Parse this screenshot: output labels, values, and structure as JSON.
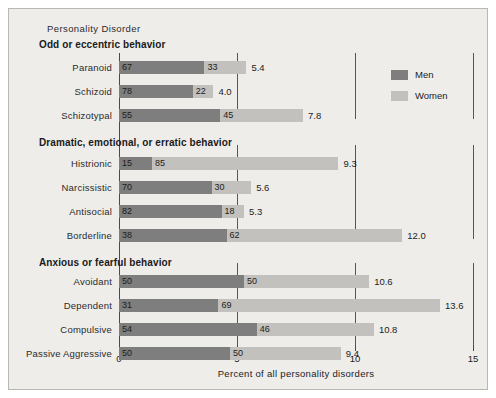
{
  "panel": {
    "background_color": "#eeedea",
    "border_color": "#b9b7b2"
  },
  "header": {
    "supertitle": "Personality Disorder"
  },
  "axis": {
    "title": "Percent of all personality disorders",
    "tick_labels": [
      "0",
      "5",
      "10",
      "15"
    ]
  },
  "legend": {
    "items": [
      {
        "label": "Men",
        "color": "#7e7e7e"
      },
      {
        "label": "Women",
        "color": "#c2c1bd"
      }
    ]
  },
  "chart_data": {
    "type": "bar",
    "orientation": "horizontal",
    "stacked": true,
    "title": "Personality Disorder",
    "xlabel": "Percent of all personality disorders",
    "ylabel": "",
    "xlim": [
      0,
      15
    ],
    "xticks": [
      0,
      5,
      10,
      15
    ],
    "grid": false,
    "legend_position": "upper-right",
    "note": "Each bar's full length is the total percent of all personality disorders; the dark and light segments split that total into the percent of cases that are Men and Women respectively.",
    "series": [
      {
        "name": "Men",
        "color": "#7e7e7e",
        "unit": "percent of cases within disorder"
      },
      {
        "name": "Women",
        "color": "#c2c1bd",
        "unit": "percent of cases within disorder"
      }
    ],
    "sections": [
      {
        "name": "Odd or eccentric behavior",
        "rows": [
          {
            "category": "Paranoid",
            "men": 67,
            "women": 33,
            "total": 5.4,
            "total_label": "5.4"
          },
          {
            "category": "Schizoid",
            "men": 78,
            "women": 22,
            "total": 4.0,
            "total_label": "4.0"
          },
          {
            "category": "Schizotypal",
            "men": 55,
            "women": 45,
            "total": 7.8,
            "total_label": "7.8"
          }
        ]
      },
      {
        "name": "Dramatic, emotional, or erratic behavior",
        "rows": [
          {
            "category": "Histrionic",
            "men": 15,
            "women": 85,
            "total": 9.3,
            "total_label": "9.3"
          },
          {
            "category": "Narcissistic",
            "men": 70,
            "women": 30,
            "total": 5.6,
            "total_label": "5.6"
          },
          {
            "category": "Antisocial",
            "men": 82,
            "women": 18,
            "total": 5.3,
            "total_label": "5.3"
          },
          {
            "category": "Borderline",
            "men": 38,
            "women": 62,
            "total": 12.0,
            "total_label": "12.0"
          }
        ]
      },
      {
        "name": "Anxious or fearful behavior",
        "rows": [
          {
            "category": "Avoidant",
            "men": 50,
            "women": 50,
            "total": 10.6,
            "total_label": "10.6"
          },
          {
            "category": "Dependent",
            "men": 31,
            "women": 69,
            "total": 13.6,
            "total_label": "13.6"
          },
          {
            "category": "Compulsive",
            "men": 54,
            "women": 46,
            "total": 10.8,
            "total_label": "10.8"
          },
          {
            "category": "Passive Aggressive",
            "men": 50,
            "women": 50,
            "total": 9.4,
            "total_label": "9.4"
          }
        ]
      }
    ]
  }
}
